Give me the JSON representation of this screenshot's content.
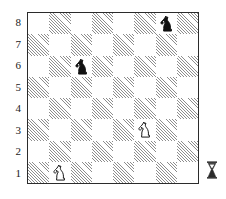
{
  "diagram": {
    "board": {
      "files": [
        "a",
        "b",
        "c",
        "d",
        "e",
        "f",
        "g",
        "h"
      ],
      "ranks": [
        "8",
        "7",
        "6",
        "5",
        "4",
        "3",
        "2",
        "1"
      ],
      "rank_labels_visible": [
        "8",
        "7",
        "6",
        "5",
        "4",
        "3",
        "2",
        "1"
      ],
      "file_labels_visible": [],
      "light_square_color": "#ffffff",
      "dark_square_color": "#8d8d8d",
      "border_color": "#2b2b2b",
      "orientation": "white-bottom",
      "size": 8
    },
    "pieces": [
      {
        "square": "g8",
        "color": "black",
        "type": "knight",
        "glyph": "♞",
        "file_index": 6,
        "rank_index": 0
      },
      {
        "square": "c6",
        "color": "black",
        "type": "knight",
        "glyph": "♞",
        "file_index": 2,
        "rank_index": 2
      },
      {
        "square": "f3",
        "color": "white",
        "type": "knight",
        "glyph": "♘",
        "file_index": 5,
        "rank_index": 5
      },
      {
        "square": "b1",
        "color": "white",
        "type": "knight",
        "glyph": "♘",
        "file_index": 1,
        "rank_index": 7
      }
    ],
    "side_to_move_marker": {
      "name": "hourglass-marker",
      "label": "side-to-move indicator",
      "position": "right-of-board-bottom"
    },
    "fen": "6n1/8/2n5/8/8/5N2/8/1N6"
  }
}
